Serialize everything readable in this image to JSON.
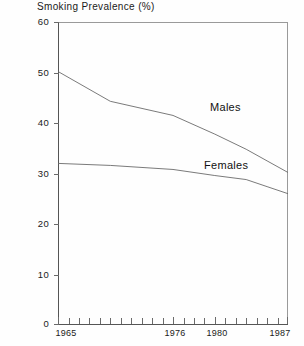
{
  "chart_data": {
    "type": "line",
    "title": "Smoking Prevalence (%)",
    "xlabel": "",
    "ylabel": "",
    "xlim": [
      1965,
      1987
    ],
    "ylim": [
      0,
      60
    ],
    "grid": false,
    "legend_position": "inline-annotation",
    "y_ticks": [
      0,
      10,
      20,
      30,
      40,
      50,
      60
    ],
    "y_tick_labels": [
      "0",
      "10",
      "20",
      "30",
      "40",
      "50",
      "60"
    ],
    "x_tick_labels": [
      "1965",
      "1976",
      "1980",
      "1987"
    ],
    "x_labeled_ticks": [
      1965,
      1976,
      1980,
      1987
    ],
    "x_minor_ticks": [
      1966,
      1967,
      1968,
      1969,
      1970,
      1971,
      1972,
      1973,
      1974,
      1975,
      1977,
      1978,
      1979,
      1981,
      1982,
      1983,
      1984,
      1985,
      1986
    ],
    "series": [
      {
        "name": "Males",
        "x": [
          1965,
          1970,
          1976,
          1980,
          1983,
          1985,
          1987
        ],
        "values": [
          50.2,
          44.3,
          41.5,
          37.8,
          34.8,
          32.5,
          30.2
        ]
      },
      {
        "name": "Females",
        "x": [
          1965,
          1970,
          1976,
          1980,
          1983,
          1985,
          1987
        ],
        "values": [
          32.0,
          31.6,
          30.8,
          29.6,
          28.8,
          27.4,
          26.0
        ]
      }
    ],
    "annotations": [
      {
        "text": "Males",
        "x": 1976,
        "y": 44
      },
      {
        "text": "Females",
        "x": 1975,
        "y": 33
      }
    ],
    "colors": {
      "line": "#6b6b6b",
      "axis": "#555555",
      "text": "#1a1a1a",
      "background": "#fefefe"
    }
  },
  "axis": {
    "y_labels": [
      "60",
      "50",
      "40",
      "30",
      "20",
      "10",
      "0"
    ],
    "x_labels": [
      "1965",
      "1976",
      "1980",
      "1987"
    ]
  }
}
